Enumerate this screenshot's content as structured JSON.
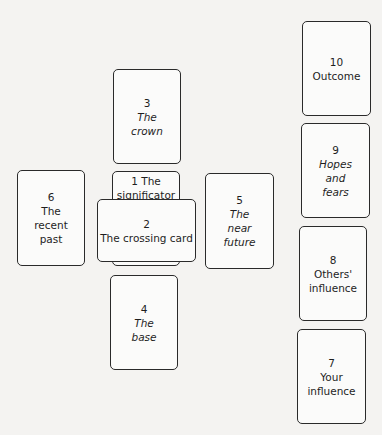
{
  "diagram": {
    "cards": [
      {
        "number": "1",
        "label": "The\nsignificator",
        "inline_label": "1 The",
        "second_line": "significator"
      },
      {
        "number": "2",
        "label": "The crossing card"
      },
      {
        "number": "3",
        "label": "The\ncrown"
      },
      {
        "number": "4",
        "label": "The\nbase"
      },
      {
        "number": "5",
        "label": "The\nnear\nfuture"
      },
      {
        "number": "6",
        "label": "The\nrecent\npast"
      },
      {
        "number": "7",
        "label": "Your\ninfluence"
      },
      {
        "number": "8",
        "label": "Others'\ninfluence"
      },
      {
        "number": "9",
        "label": "Hopes\nand\nfears"
      },
      {
        "number": "10",
        "label": "Outcome"
      }
    ]
  }
}
